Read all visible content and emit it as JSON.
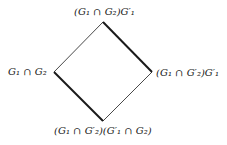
{
  "diagram": {
    "type": "lattice",
    "colors": {
      "background": "#ffffff",
      "line": "#1a1a1a",
      "text": "#1a1a1a"
    },
    "nodes": {
      "top": {
        "label": "(G₁ ∩ G₂)G′₁",
        "x": 103,
        "y": 22
      },
      "left": {
        "label": "G₁ ∩ G₂",
        "x": 54,
        "y": 72
      },
      "right": {
        "label": "(G₁ ∩ G′₂)G′₁",
        "x": 152,
        "y": 72
      },
      "bottom": {
        "label": "(G₁ ∩ G′₂)(G′₁ ∩ G₂)",
        "x": 103,
        "y": 121
      }
    },
    "edges": [
      {
        "from": "top",
        "to": "left",
        "weight": "thin"
      },
      {
        "from": "top",
        "to": "right",
        "weight": "thick"
      },
      {
        "from": "left",
        "to": "bottom",
        "weight": "thick"
      },
      {
        "from": "right",
        "to": "bottom",
        "weight": "thin"
      }
    ]
  }
}
